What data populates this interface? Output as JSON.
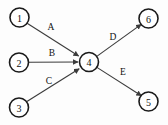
{
  "diagram": {
    "type": "directed-graph",
    "title": "",
    "background_color": "#fdfdfd",
    "node_stroke_color": "#1a1a1a",
    "edge_color": "#3b3b3b",
    "text_color": "#111111",
    "nodes": [
      {
        "id": "1",
        "label": "1",
        "cx": 19.5,
        "cy": 17.5,
        "r": 9.5
      },
      {
        "id": "2",
        "label": "2",
        "cx": 19.0,
        "cy": 62.5,
        "r": 9.5
      },
      {
        "id": "3",
        "label": "3",
        "cx": 19.0,
        "cy": 107.5,
        "r": 9.5
      },
      {
        "id": "4",
        "label": "4",
        "cx": 89.0,
        "cy": 62.0,
        "r": 9.5
      },
      {
        "id": "5",
        "label": "5",
        "cx": 148.5,
        "cy": 101.5,
        "r": 9.5
      },
      {
        "id": "6",
        "label": "6",
        "cx": 148.5,
        "cy": 18.5,
        "r": 9.5
      }
    ],
    "edges": [
      {
        "id": "A",
        "label": "A",
        "from": "1",
        "to": "4",
        "label_x": 51,
        "label_y": 27
      },
      {
        "id": "B",
        "label": "B",
        "from": "2",
        "to": "4",
        "label_x": 52,
        "label_y": 53
      },
      {
        "id": "C",
        "label": "C",
        "from": "3",
        "to": "4",
        "label_x": 49,
        "label_y": 81
      },
      {
        "id": "D",
        "label": "D",
        "from": "4",
        "to": "6",
        "label_x": 113,
        "label_y": 37
      },
      {
        "id": "E",
        "label": "E",
        "from": "4",
        "to": "5",
        "label_x": 123,
        "label_y": 72
      }
    ]
  }
}
